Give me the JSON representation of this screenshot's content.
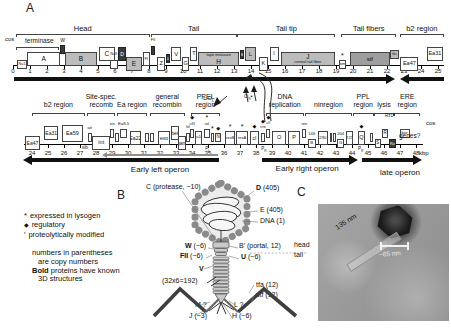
{
  "panel_labels": {
    "a": "A",
    "b": "B",
    "c": "C"
  },
  "map_rows": [
    {
      "id": "top",
      "line_from": 0,
      "line_to": 25.35,
      "ticks": [
        0,
        1,
        2,
        3,
        4,
        5,
        6,
        7,
        8,
        9,
        10,
        11,
        12,
        13,
        14,
        15,
        16,
        17,
        18,
        19,
        20,
        21,
        22,
        23,
        24,
        25
      ],
      "regions": [
        {
          "l1": "",
          "l2": "Head",
          "f": 0.15,
          "t": 8.05
        },
        {
          "l1": "",
          "l2": "Tail",
          "f": 8.1,
          "t": 13.15
        },
        {
          "l1": "",
          "l2": "Tail tip",
          "f": 13.2,
          "t": 18.95
        },
        {
          "l1": "",
          "l2": "Tail fibers",
          "f": 19.3,
          "t": 22.55
        },
        {
          "l1": "",
          "l2": "b2 region",
          "f": 22.75,
          "t": 25.35
        },
        {
          "l1": "",
          "l2": "",
          "f": 0.15,
          "t": 2.72,
          "y": 47
        }
      ],
      "genes": [
        {
          "l": "Nu1",
          "f": 0.22,
          "t": 0.85,
          "s": "w",
          "v": "l",
          "sm": 1,
          "fs": 3.8
        },
        {
          "l": "A",
          "f": 0.85,
          "t": 2.75,
          "s": "w",
          "v": "m",
          "fs": 6.5
        },
        {
          "l": "W",
          "f": 2.78,
          "t": 3.05,
          "s": "d",
          "v": "h",
          "sm": 1,
          "lp": "above",
          "fs": 5,
          "dy": -5
        },
        {
          "l": "B",
          "f": 3.05,
          "t": 4.95,
          "s": "g",
          "v": "m",
          "fs": 6.5
        },
        {
          "l": "C",
          "f": 5.05,
          "t": 6.0,
          "s": "w",
          "v": "h",
          "fs": 6.5
        },
        {
          "l": "Nu3",
          "f": 5.68,
          "t": 6.16,
          "s": "w",
          "v": "l",
          "sm": 1,
          "lp": "above",
          "fs": 3.8
        },
        {
          "l": "D",
          "f": 6.2,
          "t": 6.62,
          "s": "d",
          "v": "h",
          "fs": 5
        },
        {
          "l": "E",
          "f": 6.64,
          "t": 7.6,
          "s": "g",
          "v": "l",
          "fs": 6.5
        },
        {
          "l": "FI",
          "f": 7.62,
          "t": 8.08,
          "s": "w",
          "v": "m",
          "fs": 4.2
        },
        {
          "l": "FII",
          "f": 8.1,
          "t": 8.38,
          "s": "d",
          "v": "h",
          "sm": 1,
          "lp": "above",
          "fs": 3.8,
          "dy": -4
        },
        {
          "l": "Z",
          "f": 8.46,
          "t": 8.96,
          "s": "w",
          "v": "l",
          "fs": 5.5
        },
        {
          "l": "U",
          "f": 8.98,
          "t": 9.26,
          "s": "d",
          "v": "m",
          "sm": 1,
          "fs": 4
        },
        {
          "l": "V",
          "f": 9.32,
          "t": 9.9,
          "s": "w",
          "v": "h",
          "fs": 6
        },
        {
          "l": "G",
          "f": 9.94,
          "t": 10.38,
          "s": "w",
          "v": "l",
          "fs": 5.5
        },
        {
          "l": "T",
          "f": 10.44,
          "t": 10.84,
          "s": "w",
          "v": "h",
          "fs": 5.5
        },
        {
          "l": "H",
          "f": 10.9,
          "t": 13.3,
          "s": "g",
          "v": "m",
          "lines": [
            [
              "tape measure",
              4
            ],
            [
              "H",
              6.5
            ]
          ]
        },
        {
          "l": "M",
          "f": 13.33,
          "t": 13.6,
          "s": "d",
          "v": "h",
          "sm": 1,
          "fs": 4
        },
        {
          "l": "L",
          "f": 13.62,
          "t": 14.32,
          "s": "g",
          "v": "h",
          "fs": 6
        },
        {
          "l": "K",
          "f": 14.46,
          "t": 15.0,
          "s": "w",
          "v": "l",
          "fs": 5.5
        },
        {
          "l": "I",
          "f": 15.1,
          "t": 15.62,
          "s": "w",
          "v": "h",
          "fs": 5.5
        },
        {
          "l": "J",
          "f": 15.76,
          "t": 18.92,
          "s": "g",
          "v": "m",
          "lines": [
            [
              "J",
              6.5
            ],
            [
              "central tail fiber",
              4
            ]
          ]
        },
        {
          "l": "lom",
          "f": 19.16,
          "t": 19.6,
          "s": "w",
          "v": "l",
          "sm": 1,
          "fs": 3.8,
          "m": "*"
        },
        {
          "l": "stf",
          "f": 19.82,
          "t": 22.16,
          "s": "sg",
          "v": "m",
          "fs": 6
        },
        {
          "l": "tfa",
          "f": 22.18,
          "t": 22.68,
          "s": "g",
          "v": "h",
          "sm": 1,
          "fs": 3.8
        },
        {
          "l": "Ea47",
          "f": 22.78,
          "t": 23.85,
          "s": "w",
          "v": "l",
          "fs": 5.5
        },
        {
          "l": "Ea31",
          "f": 24.35,
          "t": 25.28,
          "s": "w",
          "v": "h",
          "fs": 5.5
        }
      ],
      "arrows": [
        {
          "f": 0.05,
          "t": 22.45,
          "dir": "r"
        },
        {
          "f": 22.78,
          "t": 25.35,
          "dir": "l"
        }
      ],
      "olabels": [],
      "promoters": [],
      "labels": [
        {
          "t": "cos",
          "x": 5,
          "y": 36,
          "fs": 6
        },
        {
          "t": "terminase",
          "x": 25,
          "y": 38,
          "fs": 6.5
        }
      ]
    },
    {
      "id": "bottom",
      "line_from": 23.5,
      "line_to": 48.45,
      "ticks": [
        24,
        25,
        26,
        27,
        28,
        29,
        30,
        31,
        32,
        33,
        34,
        35,
        36,
        37,
        38,
        39,
        40,
        41,
        42,
        43,
        44,
        45,
        46,
        47,
        48
      ],
      "regions": [
        {
          "l1": "",
          "l2": "b2 region",
          "f": 24.0,
          "t": 27.3
        },
        {
          "l1": "Site-spec.",
          "l2": "recomb",
          "f": 27.45,
          "t": 29.2
        },
        {
          "l1": "",
          "l2": "Ea region",
          "f": 29.3,
          "t": 31.2
        },
        {
          "l1": "general",
          "l2": "recombin",
          "f": 31.35,
          "t": 33.55
        },
        {
          "l1": "PPEL",
          "l2": "region",
          "f": 33.95,
          "t": 35.75
        },
        {
          "l1": "DNA",
          "l2": "replication",
          "f": 38.6,
          "t": 41.0
        },
        {
          "l1": "",
          "l2": "ninregion",
          "f": 41.05,
          "t": 44.0
        },
        {
          "l1": "PPL",
          "l2": "region",
          "f": 44.05,
          "t": 45.35
        },
        {
          "l1": "",
          "l2": "lysis",
          "f": 45.4,
          "t": 46.6
        },
        {
          "l1": "ERE",
          "l2": "region",
          "f": 46.65,
          "t": 48.25
        }
      ],
      "genes": [
        {
          "l": "Ea47",
          "f": 23.55,
          "t": 24.5,
          "s": "w",
          "v": "l",
          "fs": 5
        },
        {
          "l": "Ea31",
          "f": 24.75,
          "t": 25.65,
          "s": "w",
          "v": "h",
          "fs": 5
        },
        {
          "l": "Ea59",
          "f": 25.85,
          "t": 27.2,
          "s": "w",
          "v": "h",
          "tall": 1,
          "fs": 5.5
        },
        {
          "l": "att",
          "f": 27.5,
          "t": 27.72,
          "s": "w",
          "v": "m",
          "sm": 1,
          "lp": "above",
          "fs": 4
        },
        {
          "l": "int",
          "f": 27.78,
          "t": 28.88,
          "s": "w",
          "v": "l",
          "fs": 5.5
        },
        {
          "l": "xis",
          "f": 28.9,
          "t": 29.14,
          "s": "w",
          "v": "h",
          "sm": 1,
          "lp": "above",
          "fs": 4
        },
        {
          "l": "",
          "f": 29.2,
          "t": 29.42,
          "s": "w",
          "v": "m",
          "sm": 1
        },
        {
          "l": "Ea8.5",
          "f": 29.48,
          "t": 29.96,
          "s": "w",
          "v": "h",
          "sm": 1,
          "lp": "above",
          "fs": 4.2
        },
        {
          "l": "Ea22",
          "f": 30.1,
          "t": 30.82,
          "s": "w",
          "v": "m",
          "fs": 5
        },
        {
          "l": "",
          "f": 31.05,
          "t": 31.3,
          "s": "w",
          "v": "m",
          "sm": 1
        },
        {
          "l": "",
          "f": 31.4,
          "t": 31.62,
          "s": "w",
          "v": "m",
          "sm": 1
        },
        {
          "l": "exo",
          "f": 31.88,
          "t": 32.62,
          "s": "w",
          "v": "m",
          "fs": 5
        },
        {
          "l": "bet",
          "f": 32.66,
          "t": 33.18,
          "s": "w",
          "v": "h",
          "fs": 5
        },
        {
          "l": "gam",
          "f": 33.14,
          "t": 33.6,
          "s": "w",
          "v": "l",
          "fs": 5
        },
        {
          "l": "kil",
          "f": 33.64,
          "t": 33.86,
          "s": "w",
          "v": "m",
          "sm": 1,
          "lp": "above",
          "fs": 3.8
        },
        {
          "l": "cIII",
          "f": 33.9,
          "t": 34.12,
          "s": "w",
          "v": "h",
          "sm": 1,
          "lp": "above",
          "fs": 4,
          "m": "d"
        },
        {
          "l": "Ea10",
          "f": 34.16,
          "t": 34.62,
          "s": "w",
          "v": "m",
          "fs": 3.8
        },
        {
          "l": "ral",
          "f": 34.76,
          "t": 35.1,
          "s": "w",
          "v": "h",
          "sm": 1,
          "lp": "above",
          "fs": 4,
          "m": "*"
        },
        {
          "l": "",
          "f": 35.16,
          "t": 35.4,
          "s": "w",
          "v": "m",
          "sm": 1,
          "m": "*"
        },
        {
          "l": "N",
          "f": 35.46,
          "t": 35.8,
          "s": "w",
          "v": "m",
          "sm": 1,
          "fs": 4.5,
          "m": "d"
        },
        {
          "l": "rexB",
          "f": 36.05,
          "t": 36.7,
          "s": "w",
          "v": "m",
          "fs": 4,
          "m": "*"
        },
        {
          "l": "rexA",
          "f": 36.76,
          "t": 37.5,
          "s": "w",
          "v": "m",
          "fs": 4,
          "m": "*"
        },
        {
          "l": "cI",
          "f": 37.62,
          "t": 38.2,
          "s": "w",
          "v": "m",
          "fs": 5,
          "m": "d"
        },
        {
          "l": "cro",
          "f": 38.3,
          "t": 38.56,
          "s": "w",
          "v": "m",
          "sm": 1,
          "lp": "above",
          "fs": 3.8,
          "m": "d"
        },
        {
          "l": "cII",
          "f": 38.64,
          "t": 38.9,
          "s": "w",
          "v": "h",
          "sm": 1,
          "lp": "above",
          "fs": 3.8,
          "m": "d"
        },
        {
          "l": "O",
          "f": 38.98,
          "t": 39.9,
          "s": "w",
          "v": "m",
          "fs": 5.5
        },
        {
          "l": "P",
          "f": 40.0,
          "t": 40.76,
          "s": "w",
          "v": "m",
          "fs": 5.5
        },
        {
          "l": "ren",
          "f": 40.9,
          "t": 41.14,
          "s": "w",
          "v": "h",
          "sm": 1,
          "lp": "above",
          "fs": 4
        },
        {
          "l": "B",
          "f": 41.25,
          "t": 41.72,
          "s": "w",
          "v": "l",
          "sm": 1,
          "la": "146",
          "fs": 4.2
        },
        {
          "l": "290",
          "f": 41.86,
          "t": 42.5,
          "s": "w",
          "v": "m",
          "fs": 4.2
        },
        {
          "l": "",
          "f": 42.6,
          "t": 42.78,
          "s": "w",
          "v": "m",
          "sm": 1
        },
        {
          "l": "",
          "f": 42.84,
          "t": 43.0,
          "s": "w",
          "v": "m",
          "sm": 1
        },
        {
          "l": "G",
          "f": 43.06,
          "t": 43.52,
          "s": "w",
          "v": "l",
          "sm": 1,
          "la": "204",
          "fs": 4.2
        },
        {
          "l": "221",
          "f": 43.62,
          "t": 44.08,
          "s": "w",
          "v": "m",
          "fs": 4.2
        },
        {
          "l": "Q",
          "f": 44.35,
          "t": 44.82,
          "s": "w",
          "v": "m",
          "fs": 5.5,
          "m": "d"
        },
        {
          "l": "",
          "f": 45.1,
          "t": 45.32,
          "s": "w",
          "v": "m",
          "sm": 1
        },
        {
          "l": "S",
          "f": 45.42,
          "t": 45.8,
          "s": "w",
          "v": "l",
          "sm": 1,
          "fs": 4.5
        },
        {
          "l": "R",
          "f": 45.86,
          "t": 46.28,
          "s": "w",
          "v": "h",
          "sm": 1,
          "fs": 4.5
        },
        {
          "l": "Rz",
          "f": 46.3,
          "t": 46.76,
          "s": "d",
          "v": "l",
          "sm": 1,
          "fs": 4
        },
        {
          "l": "bor",
          "f": 46.98,
          "t": 47.6,
          "s": "w",
          "v": "h",
          "sm": 1,
          "fs": 4.2
        }
      ],
      "arrows": [
        {
          "f": 23.45,
          "t": 35.7,
          "dir": "l"
        },
        {
          "f": 28.35,
          "t": 35.6,
          "dir": "l",
          "thin": 1,
          "dy": -4
        },
        {
          "f": 38.35,
          "t": 44.4,
          "dir": "r"
        },
        {
          "f": 44.6,
          "t": 48.4,
          "dir": "r"
        }
      ],
      "olabels": [
        {
          "t": "Early left operon",
          "kb": 32.0,
          "y": 166,
          "fs": 8
        },
        {
          "t": "Early right operon",
          "kb": 41.2,
          "y": 165,
          "fs": 8
        },
        {
          "t": "late operon",
          "kb": 47.0,
          "y": 169,
          "fs": 8
        }
      ],
      "promoters": [
        {
          "base": "P",
          "sub": "L",
          "kb": 34.95
        },
        {
          "base": "P",
          "sub": "R",
          "kb": 38.45
        },
        {
          "base": "P",
          "sub": "R'",
          "kb": 44.5
        }
      ],
      "labels": [
        {
          "t": "sib",
          "x": 82,
          "y": 146,
          "fs": 4.5
        },
        {
          "t": "Rz1*",
          "x": 385,
          "y": 114,
          "fs": 4.5
        },
        {
          "t": "cos",
          "x": 426,
          "y": 120,
          "fs": 6
        },
        {
          "t": "genes?",
          "x": 399,
          "y": 133,
          "fs": 6.5
        },
        {
          "t": "kbp",
          "x": 419,
          "y": 150,
          "fs": 6
        },
        {
          "pre": "⊏",
          "base": "O",
          "sub": "L",
          "x": 203,
          "y": 96,
          "fs": 5.5
        },
        {
          "base": "O",
          "sub": "R",
          "suf": "▪",
          "x": 244,
          "y": 94,
          "fs": 5.5
        }
      ]
    }
  ],
  "legend": {
    "symbols": [
      {
        "sym": "*",
        "text": "expressed in lysogen"
      },
      {
        "sym": "◆",
        "text": "regulatory"
      },
      {
        "sym": "′",
        "text": "proteolytically modified"
      }
    ],
    "notes": [
      {
        "bold": "",
        "text": "numbers in parentheses",
        "ind": 0
      },
      {
        "bold": "",
        "text": "are copy numbers",
        "ind": 1
      },
      {
        "bold": "Bold",
        "text": " proteins have known",
        "ind": 0
      },
      {
        "bold": "",
        "text": "3D structures",
        "ind": 1
      }
    ]
  },
  "phage": {
    "labels": [
      {
        "b": "",
        "t": "C (protease, ~10)",
        "x": 146,
        "y": 183
      },
      {
        "b": "D",
        "t": " (405)",
        "x": 256,
        "y": 184
      },
      {
        "b": "",
        "t": "E (405)",
        "x": 260,
        "y": 206
      },
      {
        "b": "",
        "t": "DNA (1)",
        "x": 260,
        "y": 217
      },
      {
        "b": "W",
        "t": " (~6)",
        "x": 185,
        "y": 242
      },
      {
        "b": "",
        "t": "B' (portal, 12)",
        "x": 239,
        "y": 242
      },
      {
        "b": "FII",
        "t": " (~6)",
        "x": 180,
        "y": 252
      },
      {
        "b": "U",
        "t": " (~6)",
        "x": 241,
        "y": 253
      },
      {
        "b": "",
        "t": "head",
        "x": 294,
        "y": 241
      },
      {
        "b": "",
        "t": "tail",
        "x": 294,
        "y": 251
      },
      {
        "b": "V",
        "t": "",
        "x": 199,
        "y": 265
      },
      {
        "b": "",
        "t": "(32x6=192)",
        "x": 162,
        "y": 277
      },
      {
        "b": "",
        "t": "tfa (12)",
        "x": 256,
        "y": 281
      },
      {
        "b": "",
        "t": "stf (12)",
        "x": 256,
        "y": 291
      },
      {
        "b": "",
        "t": "M ?",
        "x": 195,
        "y": 301
      },
      {
        "b": "",
        "t": "L ?",
        "x": 234,
        "y": 301
      },
      {
        "b": "",
        "t": "J (~3)",
        "x": 189,
        "y": 312
      },
      {
        "b": "",
        "t": "H (~6)",
        "x": 232,
        "y": 312
      }
    ]
  },
  "micrograph": {
    "tail_length": "135 nm",
    "scale": "~65 nm"
  }
}
